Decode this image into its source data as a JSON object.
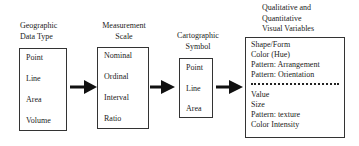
{
  "columns": [
    {
      "title_lines": [
        "Geographic",
        "Data Type"
      ],
      "items": [
        "Point",
        "Line",
        "Area",
        "Volume"
      ]
    },
    {
      "title_lines": [
        "Measurement",
        "Scale"
      ],
      "items": [
        "Nominal",
        "Ordinal",
        "Interval",
        "Ratio"
      ]
    },
    {
      "title_lines": [
        "Cartographic",
        "Symbol"
      ],
      "items": [
        "Point",
        "Line",
        "Area"
      ]
    },
    {
      "title_lines": [
        "Qualitative and",
        "Quantitative",
        "Visual Variables"
      ],
      "qualitative_items": [
        "Shape/Form",
        "Color (Hue)",
        "Pattern: Arrangement",
        "Pattern: Orientation"
      ],
      "quantitative_items": [
        "Value",
        "Size",
        "Pattern: texture",
        "Color Intensity"
      ]
    }
  ],
  "arrows": [
    "arrow-right",
    "arrow-right",
    "arrow-right"
  ]
}
